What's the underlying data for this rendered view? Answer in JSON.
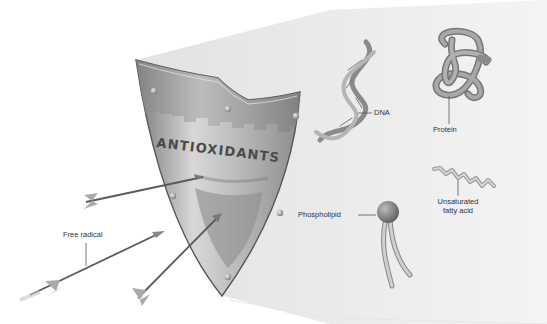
{
  "figure": {
    "type": "illustration"
  },
  "shield": {
    "label": "ANTIOXIDANTS",
    "color_light": "#c9c9c9",
    "color_dark": "#8a8a8a",
    "band_color": "#9e9e9e"
  },
  "attackers": {
    "label": "Free radical",
    "arrow_count": 4
  },
  "molecules": [
    {
      "id": "dna",
      "label": "DNA"
    },
    {
      "id": "protein",
      "label": "Protein"
    },
    {
      "id": "phospholipid",
      "label": "Phospholipid"
    },
    {
      "id": "fatty-acid",
      "label_line1": "Unsaturated",
      "label_line2": "fatty acid"
    }
  ],
  "colors": {
    "background": "#ffffff",
    "protected_zone": "#ececec",
    "label_text": "#333333",
    "leader_line": "#555555",
    "molecule_gray": "#9a9a9a",
    "arrow_shaft": "#5a5a5a"
  }
}
